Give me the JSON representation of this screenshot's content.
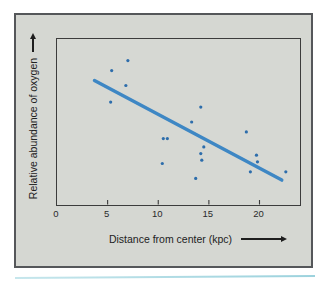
{
  "figure": {
    "page_background": "#ffffff",
    "panel_background": "#d5d7d2",
    "panel_border_color": "#55575a",
    "bottom_rule_color": "#9cd2dd"
  },
  "chart_data": {
    "type": "scatter",
    "title": "",
    "xlabel": "Distance from center (kpc)",
    "ylabel": "Relative abundance of oxygen",
    "x_ticks": [
      "0",
      "5",
      "10",
      "15",
      "20"
    ],
    "x_tick_values": [
      0,
      5,
      10,
      15,
      20
    ],
    "y_ticks": [],
    "xlim": [
      0,
      24
    ],
    "ylim": [
      0,
      10
    ],
    "grid": false,
    "legend": null,
    "points": [
      [
        7.0,
        8.7
      ],
      [
        5.4,
        8.1
      ],
      [
        6.8,
        7.2
      ],
      [
        5.3,
        6.2
      ],
      [
        14.2,
        5.9
      ],
      [
        13.3,
        5.0
      ],
      [
        10.5,
        4.0
      ],
      [
        10.9,
        4.0
      ],
      [
        14.5,
        3.5
      ],
      [
        14.2,
        3.1
      ],
      [
        14.3,
        2.7
      ],
      [
        10.4,
        2.5
      ],
      [
        13.7,
        1.6
      ],
      [
        18.7,
        4.4
      ],
      [
        19.7,
        3.0
      ],
      [
        19.8,
        2.6
      ],
      [
        19.1,
        2.0
      ],
      [
        22.6,
        2.0
      ]
    ],
    "trend_line": {
      "x": [
        3.7,
        22.2
      ],
      "y": [
        7.5,
        1.5
      ]
    },
    "point_color": "#2d6dab",
    "line_color": "#3e87c4",
    "axis_color": "#3a3a3a",
    "tick_label_color": "#2a2a2a"
  }
}
